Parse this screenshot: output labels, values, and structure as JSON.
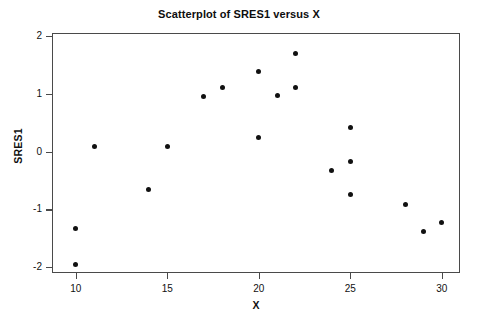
{
  "chart_data": {
    "type": "scatter",
    "title": "Scatterplot of SRES1 versus X",
    "xlabel": "X",
    "ylabel": "SRES1",
    "xlim": [
      8.7,
      31.0
    ],
    "ylim": [
      -2.1,
      2.05
    ],
    "xticks": [
      10,
      15,
      20,
      25,
      30
    ],
    "yticks": [
      2,
      1,
      0,
      -1,
      -2
    ],
    "xtick_labels": [
      "10",
      "15",
      "20",
      "25",
      "30"
    ],
    "ytick_labels": [
      "2",
      "1",
      "0",
      "-1",
      "-2"
    ],
    "grid": false,
    "legend": null,
    "marker": "filled-circle",
    "marker_color": "#111111",
    "frame_color": "#4a4a4a",
    "background": "#ffffff",
    "x": [
      10,
      10,
      11,
      14,
      15,
      17,
      18,
      20,
      20,
      21,
      22,
      22,
      24,
      25,
      25,
      25,
      28,
      29,
      30
    ],
    "y": [
      -1.33,
      -1.95,
      0.08,
      -0.65,
      0.08,
      0.95,
      1.1,
      1.38,
      0.25,
      0.97,
      1.7,
      1.1,
      -0.33,
      0.42,
      -0.18,
      -0.75,
      -0.92,
      -1.38,
      -1.22
    ],
    "points": [
      {
        "x": 10,
        "y": -1.33
      },
      {
        "x": 10,
        "y": -1.95
      },
      {
        "x": 11,
        "y": 0.08
      },
      {
        "x": 14,
        "y": -0.65
      },
      {
        "x": 15,
        "y": 0.08
      },
      {
        "x": 17,
        "y": 0.95
      },
      {
        "x": 18,
        "y": 1.1
      },
      {
        "x": 20,
        "y": 1.38
      },
      {
        "x": 20,
        "y": 0.25
      },
      {
        "x": 21,
        "y": 0.97
      },
      {
        "x": 22,
        "y": 1.7
      },
      {
        "x": 22,
        "y": 1.1
      },
      {
        "x": 24,
        "y": -0.33
      },
      {
        "x": 25,
        "y": 0.42
      },
      {
        "x": 25,
        "y": -0.18
      },
      {
        "x": 25,
        "y": -0.75
      },
      {
        "x": 28,
        "y": -0.92
      },
      {
        "x": 29,
        "y": -1.38
      },
      {
        "x": 30,
        "y": -1.22
      }
    ]
  }
}
